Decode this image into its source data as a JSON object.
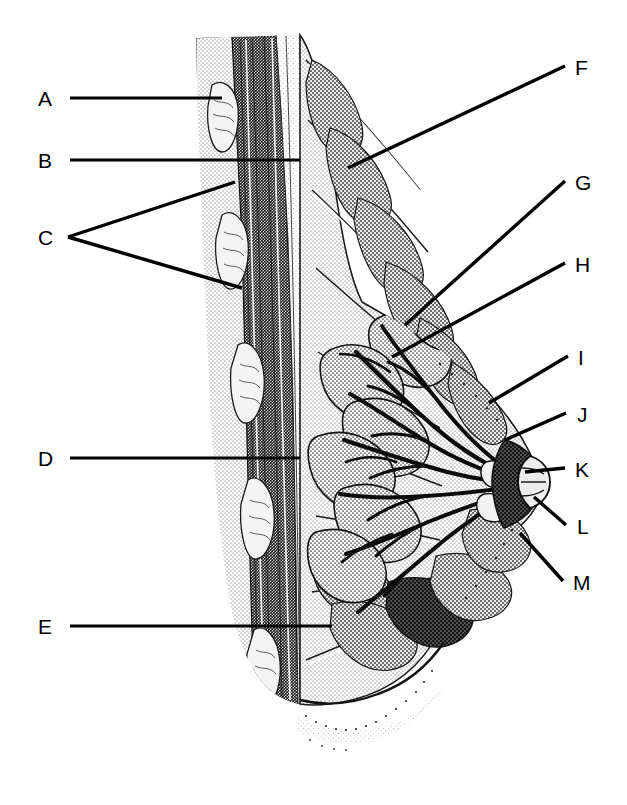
{
  "figure": {
    "kind": "anatomical-illustration",
    "style": "black-and-white halftone stipple line drawing",
    "background_color": "#ffffff",
    "ink_color": "#000000",
    "leader_line_color": "#000000",
    "orientation": "chest wall at left, nipple pointing right"
  },
  "labels": {
    "A": {
      "text": "A",
      "x": 38,
      "y": 88,
      "side": "left"
    },
    "B": {
      "text": "B",
      "x": 38,
      "y": 150,
      "side": "left"
    },
    "C": {
      "text": "C",
      "x": 38,
      "y": 227,
      "side": "left"
    },
    "D": {
      "text": "D",
      "x": 38,
      "y": 448,
      "side": "left"
    },
    "E": {
      "text": "E",
      "x": 38,
      "y": 616,
      "side": "left"
    },
    "F": {
      "text": "F",
      "x": 575,
      "y": 57,
      "side": "right"
    },
    "G": {
      "text": "G",
      "x": 575,
      "y": 172,
      "side": "right"
    },
    "H": {
      "text": "H",
      "x": 575,
      "y": 254,
      "side": "right"
    },
    "I": {
      "text": "I",
      "x": 578,
      "y": 347,
      "side": "right"
    },
    "J": {
      "text": "J",
      "x": 577,
      "y": 404,
      "side": "right"
    },
    "K": {
      "text": "K",
      "x": 575,
      "y": 459,
      "side": "right"
    },
    "L": {
      "text": "L",
      "x": 577,
      "y": 516,
      "side": "right"
    },
    "M": {
      "text": "M",
      "x": 573,
      "y": 572,
      "side": "right"
    }
  },
  "leader_lines": [
    {
      "id": "leader-A",
      "label": "A",
      "points": "70,98 222,98",
      "width": 3.2
    },
    {
      "id": "leader-B",
      "label": "B",
      "points": "70,160 300,160",
      "width": 3.2
    },
    {
      "id": "leader-C-upper",
      "label": "C",
      "points": "68,237 235,182",
      "width": 3.4
    },
    {
      "id": "leader-C-lower",
      "label": "C",
      "points": "68,237 242,288",
      "width": 3.4
    },
    {
      "id": "leader-D",
      "label": "D",
      "points": "70,458 300,458",
      "width": 3.2
    },
    {
      "id": "leader-E",
      "label": "E",
      "points": "70,626 332,626",
      "width": 3.2
    },
    {
      "id": "leader-F",
      "label": "F",
      "points": "565,66 348,168",
      "width": 3.4
    },
    {
      "id": "leader-G",
      "label": "G",
      "points": "565,181 405,325",
      "width": 3.4
    },
    {
      "id": "leader-H",
      "label": "H",
      "points": "565,263 392,357",
      "width": 3.4
    },
    {
      "id": "leader-I",
      "label": "I",
      "points": "568,356 489,403",
      "width": 3.4
    },
    {
      "id": "leader-J",
      "label": "J",
      "points": "566,413 505,440",
      "width": 3.4
    },
    {
      "id": "leader-K",
      "label": "K",
      "points": "565,468 525,472",
      "width": 3.4
    },
    {
      "id": "leader-L",
      "label": "L",
      "points": "566,525 534,497",
      "width": 3.4
    },
    {
      "id": "leader-M",
      "label": "M",
      "points": "563,581 520,533",
      "width": 3.4
    }
  ]
}
